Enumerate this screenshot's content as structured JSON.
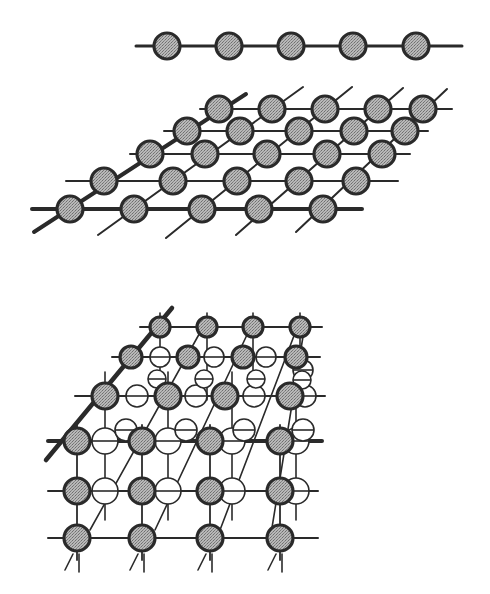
{
  "figure": {
    "colors": {
      "background": "#ffffff",
      "bond": "#2a2a2a",
      "atom_fill": "#a9a9a9",
      "atom_stroke": "#2a2a2a",
      "hollow_fill": "#ffffff"
    },
    "panels": [
      {
        "id": "chain-1d",
        "label": "one-dimensional chain",
        "line": {
          "x1": 136,
          "y1": 46,
          "x2": 462,
          "y2": 46
        },
        "atoms": [
          {
            "x": 167,
            "y": 46
          },
          {
            "x": 229,
            "y": 46
          },
          {
            "x": 291,
            "y": 46
          },
          {
            "x": 353,
            "y": 46
          },
          {
            "x": 416,
            "y": 46
          }
        ],
        "radius": 13
      },
      {
        "id": "lattice-2d",
        "label": "two-dimensional lattice",
        "rows": [
          [
            [
              70,
              209
            ],
            [
              134,
              209
            ],
            [
              202,
              209
            ],
            [
              259,
              209
            ],
            [
              323,
              209
            ]
          ],
          [
            [
              104,
              181
            ],
            [
              173,
              181
            ],
            [
              237,
              181
            ],
            [
              299,
              181
            ],
            [
              356,
              181
            ]
          ],
          [
            [
              150,
              154
            ],
            [
              205,
              154
            ],
            [
              267,
              154
            ],
            [
              327,
              154
            ],
            [
              382,
              154
            ]
          ],
          [
            [
              187,
              131
            ],
            [
              240,
              131
            ],
            [
              299,
              131
            ],
            [
              354,
              131
            ],
            [
              405,
              131
            ]
          ],
          [
            [
              219,
              109
            ],
            [
              272,
              109
            ],
            [
              325,
              109
            ],
            [
              378,
              109
            ],
            [
              423,
              109
            ]
          ]
        ],
        "row_lines": [
          {
            "x1": 32,
            "x2": 362,
            "y": 209,
            "heavy": true
          },
          {
            "x1": 66,
            "x2": 398,
            "y": 181,
            "heavy": false
          },
          {
            "x1": 130,
            "x2": 410,
            "y": 154,
            "heavy": false
          },
          {
            "x1": 164,
            "x2": 428,
            "y": 131,
            "heavy": false
          },
          {
            "x1": 200,
            "x2": 452,
            "y": 109,
            "heavy": false
          }
        ],
        "column_lines": [
          {
            "x1": 34,
            "y1": 232,
            "x2": 246,
            "y2": 94,
            "heavy": true
          },
          {
            "x1": 98,
            "y1": 235,
            "x2": 303,
            "y2": 87,
            "heavy": false
          },
          {
            "x1": 166,
            "y1": 238,
            "x2": 352,
            "y2": 87,
            "heavy": false
          },
          {
            "x1": 236,
            "y1": 235,
            "x2": 403,
            "y2": 88,
            "heavy": false
          },
          {
            "x1": 296,
            "y1": 232,
            "x2": 447,
            "y2": 89,
            "heavy": false
          }
        ],
        "radius": 13
      },
      {
        "id": "lattice-3d",
        "label": "three-dimensional lattice",
        "front_atoms": [
          [
            [
              77,
              441
            ],
            [
              142,
              441
            ],
            [
              210,
              441
            ],
            [
              280,
              441
            ]
          ],
          [
            [
              77,
              491
            ],
            [
              142,
              491
            ],
            [
              210,
              491
            ],
            [
              280,
              491
            ]
          ],
          [
            [
              77,
              538
            ],
            [
              142,
              538
            ],
            [
              210,
              538
            ],
            [
              280,
              538
            ]
          ]
        ],
        "mid_atoms": [
          [
            [
              105,
              396
            ],
            [
              168,
              396
            ],
            [
              225,
              396
            ],
            [
              290,
              396
            ]
          ],
          [
            [
              131,
              357
            ],
            [
              188,
              357
            ],
            [
              243,
              357
            ],
            [
              296,
              357
            ]
          ]
        ],
        "top_atoms": [
          [
            160,
            327
          ],
          [
            207,
            327
          ],
          [
            253,
            327
          ],
          [
            300,
            327
          ]
        ],
        "hollow_atoms": [
          {
            "x": 105,
            "y": 441,
            "r": 13
          },
          {
            "x": 168,
            "y": 441,
            "r": 13
          },
          {
            "x": 232,
            "y": 441,
            "r": 13
          },
          {
            "x": 296,
            "y": 441,
            "r": 13
          },
          {
            "x": 105,
            "y": 491,
            "r": 13
          },
          {
            "x": 168,
            "y": 491,
            "r": 13
          },
          {
            "x": 232,
            "y": 491,
            "r": 13
          },
          {
            "x": 296,
            "y": 491,
            "r": 13
          },
          {
            "x": 137,
            "y": 396,
            "r": 11
          },
          {
            "x": 196,
            "y": 396,
            "r": 11
          },
          {
            "x": 254,
            "y": 396,
            "r": 11
          },
          {
            "x": 305,
            "y": 396,
            "r": 11
          },
          {
            "x": 126,
            "y": 430,
            "r": 11
          },
          {
            "x": 186,
            "y": 430,
            "r": 11
          },
          {
            "x": 244,
            "y": 430,
            "r": 11
          },
          {
            "x": 303,
            "y": 430,
            "r": 11
          },
          {
            "x": 160,
            "y": 357,
            "r": 10
          },
          {
            "x": 214,
            "y": 357,
            "r": 10
          },
          {
            "x": 266,
            "y": 357,
            "r": 10
          },
          {
            "x": 303,
            "y": 370,
            "r": 10
          },
          {
            "x": 157,
            "y": 379,
            "r": 9
          },
          {
            "x": 204,
            "y": 379,
            "r": 9
          },
          {
            "x": 256,
            "y": 379,
            "r": 9
          },
          {
            "x": 302,
            "y": 380,
            "r": 9
          }
        ],
        "row_lines": [
          {
            "x1": 48,
            "x2": 322,
            "y": 441,
            "heavy": true
          },
          {
            "x1": 48,
            "x2": 318,
            "y": 491,
            "heavy": false
          },
          {
            "x1": 48,
            "x2": 318,
            "y": 538,
            "heavy": false
          },
          {
            "x1": 75,
            "x2": 325,
            "y": 396,
            "heavy": false
          },
          {
            "x1": 112,
            "x2": 320,
            "y": 357,
            "heavy": false
          },
          {
            "x1": 140,
            "x2": 322,
            "y": 327,
            "heavy": false
          }
        ],
        "radius": 13
      }
    ]
  }
}
